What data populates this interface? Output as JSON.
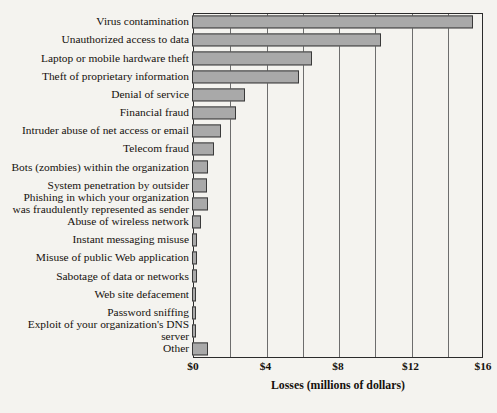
{
  "chart_data": {
    "type": "bar",
    "orientation": "horizontal",
    "title": "",
    "xlabel": "Losses (millions of dollars)",
    "ylabel": "",
    "xlim": [
      0,
      16
    ],
    "xticks": [
      0,
      4,
      8,
      12,
      16
    ],
    "xtick_labels": [
      "$0",
      "$4",
      "$8",
      "$12",
      "$16"
    ],
    "gridlines": [
      2,
      4,
      6,
      8,
      10,
      12,
      14
    ],
    "grid": true,
    "legend": null,
    "bar_color": "#a9a9a9",
    "bar_edge_color": "#3a3a3a",
    "background_color": "#f4f3ef",
    "categories": [
      "Virus contamination",
      "Unauthorized access to data",
      "Laptop or mobile hardware theft",
      "Theft of proprietary information",
      "Denial of service",
      "Financial fraud",
      "Intruder abuse of net access or email",
      "Telecom fraud",
      "Bots (zombies) within the organization",
      "System penetration by outsider",
      "Phishing in which your organization\nwas fraudulently represented as sender",
      "Abuse of wireless network",
      "Instant messaging misuse",
      "Misuse of public Web application",
      "Sabotage of data or networks",
      "Web site defacement",
      "Password sniffing",
      "Exploit of your organization's DNS server",
      "Other"
    ],
    "values": [
      15.5,
      10.4,
      6.6,
      5.9,
      2.9,
      2.4,
      1.6,
      1.2,
      0.9,
      0.8,
      0.9,
      0.5,
      0.3,
      0.3,
      0.3,
      0.2,
      0.2,
      0.2,
      0.9
    ]
  }
}
